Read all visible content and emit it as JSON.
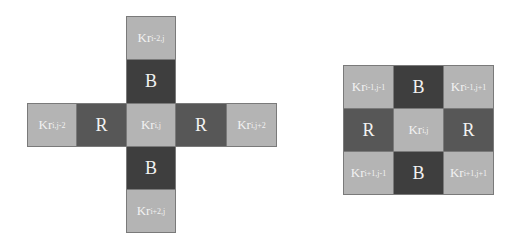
{
  "colors": {
    "light_cell": "#b4b4b4",
    "blue_cell": "#3e3e3e",
    "red_cell": "#575757",
    "text": "#f2f2f2"
  },
  "cross_pattern": {
    "top2": {
      "base": "Kr",
      "sub": "i-2,j"
    },
    "top1": {
      "label": "B"
    },
    "left2": {
      "base": "Kr",
      "sub": "i,j-2"
    },
    "left1": {
      "label": "R"
    },
    "center": {
      "base": "Kr",
      "sub": "i,j"
    },
    "right1": {
      "label": "R"
    },
    "right2": {
      "base": "Kr",
      "sub": "i,j+2"
    },
    "bottom1": {
      "label": "B"
    },
    "bottom2": {
      "base": "Kr",
      "sub": "i+2,j"
    }
  },
  "grid_pattern": {
    "r0c0": {
      "base": "Kr",
      "sub": "i-1,j-1"
    },
    "r0c1": {
      "label": "B"
    },
    "r0c2": {
      "base": "Kr",
      "sub": "i-1,j+1"
    },
    "r1c0": {
      "label": "R"
    },
    "r1c1": {
      "base": "Kr",
      "sub": "i,j"
    },
    "r1c2": {
      "label": "R"
    },
    "r2c0": {
      "base": "Kr",
      "sub": "i+1,j-1"
    },
    "r2c1": {
      "label": "B"
    },
    "r2c2": {
      "base": "Kr",
      "sub": "i+1,j+1"
    }
  }
}
